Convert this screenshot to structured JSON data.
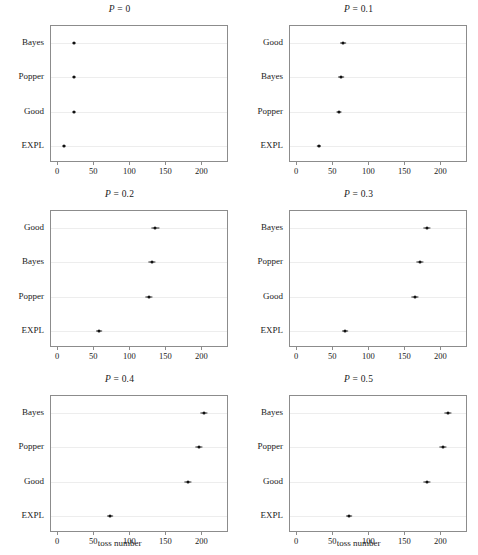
{
  "figure": {
    "xlabel": "toss number",
    "xticks": [
      0,
      50,
      100,
      150,
      200
    ],
    "xlim": [
      -10,
      237
    ],
    "gridlines": true,
    "marker": "point-with-errorbar"
  },
  "chart_data": {
    "type": "scatter",
    "title": "",
    "xlabel": "toss number",
    "ylabel": "",
    "xlim": [
      -10,
      237
    ],
    "xticks": [
      0,
      50,
      100,
      150,
      200
    ],
    "grid": true,
    "legend": "none",
    "panels": [
      {
        "title": "P = 0",
        "title_prefix": "P",
        "title_eq": " = ",
        "title_value": "0",
        "categories": [
          "Bayes",
          "Popper",
          "Good",
          "EXPL"
        ],
        "values": [
          22,
          22,
          22,
          8
        ],
        "errors": [
          0.8,
          0.8,
          0.8,
          0.8
        ],
        "xlabel": "",
        "show_xlabel": false
      },
      {
        "title": "P = 0.1",
        "title_prefix": "P",
        "title_eq": " = ",
        "title_value": "0.1",
        "categories": [
          "Good",
          "Bayes",
          "Popper",
          "EXPL"
        ],
        "values": [
          64,
          61,
          58,
          30
        ],
        "errors": [
          4,
          4,
          3.5,
          3
        ],
        "xlabel": "",
        "show_xlabel": false
      },
      {
        "title": "P = 0.2",
        "title_prefix": "P",
        "title_eq": " = ",
        "title_value": "0.2",
        "categories": [
          "Good",
          "Bayes",
          "Popper",
          "EXPL"
        ],
        "values": [
          135,
          130,
          126,
          57
        ],
        "errors": [
          5,
          5,
          5,
          4
        ],
        "xlabel": "",
        "show_xlabel": false
      },
      {
        "title": "P = 0.3",
        "title_prefix": "P",
        "title_eq": " = ",
        "title_value": "0.3",
        "categories": [
          "Bayes",
          "Popper",
          "Good",
          "EXPL"
        ],
        "values": [
          180,
          170,
          163,
          66
        ],
        "errors": [
          5,
          5,
          5,
          4
        ],
        "xlabel": "",
        "show_xlabel": false
      },
      {
        "title": "P = 0.4",
        "title_prefix": "P",
        "title_eq": " = ",
        "title_value": "0.4",
        "categories": [
          "Bayes",
          "Popper",
          "Good",
          "EXPL"
        ],
        "values": [
          202,
          195,
          180,
          72
        ],
        "errors": [
          5,
          5,
          5,
          4
        ],
        "xlabel": "toss number",
        "show_xlabel": true
      },
      {
        "title": "P = 0.5",
        "title_prefix": "P",
        "title_eq": " = ",
        "title_value": "0.5",
        "categories": [
          "Bayes",
          "Popper",
          "Good",
          "EXPL"
        ],
        "values": [
          209,
          202,
          180,
          72
        ],
        "errors": [
          5,
          5,
          5,
          4
        ],
        "xlabel": "toss number",
        "show_xlabel": true
      }
    ]
  }
}
